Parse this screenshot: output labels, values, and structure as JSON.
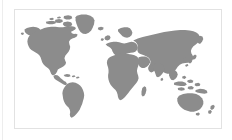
{
  "panel": {
    "type": "world-map-figure",
    "title": "World Map",
    "alt_text": "Grey silhouette world map on a white background",
    "background_color": "#ffffff",
    "border_color": "#e2e2e2",
    "land_color": "#8c8c8c",
    "ocean_color": "#ffffff",
    "divider_color": "#ededed",
    "projection": "equirectangular"
  },
  "map": {
    "regions": [
      {
        "name": "North America"
      },
      {
        "name": "Greenland"
      },
      {
        "name": "South America"
      },
      {
        "name": "Europe"
      },
      {
        "name": "Africa"
      },
      {
        "name": "Asia"
      },
      {
        "name": "Southeast Asia"
      },
      {
        "name": "Australia"
      },
      {
        "name": "New Zealand"
      },
      {
        "name": "Japan"
      },
      {
        "name": "Madagascar"
      },
      {
        "name": "British Isles"
      }
    ],
    "labels": [],
    "legend": [],
    "markers": []
  }
}
